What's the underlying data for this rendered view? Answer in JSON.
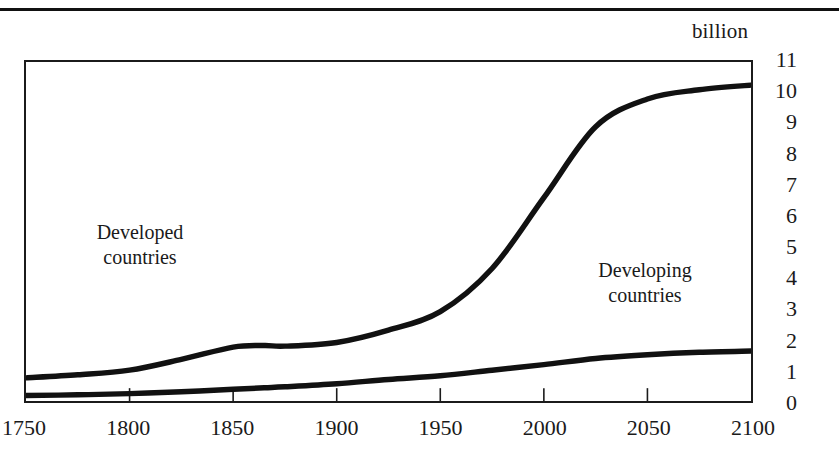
{
  "figure": {
    "unit_caption": "billion",
    "rule": true
  },
  "axes": {
    "y_ticks": [
      0,
      1,
      2,
      3,
      4,
      5,
      6,
      7,
      8,
      9,
      10,
      11
    ],
    "y_tick_labels": [
      "0",
      "1",
      "2",
      "3",
      "4",
      "5",
      "6",
      "7",
      "8",
      "9",
      "10",
      "11"
    ],
    "x_ticks": [
      1750,
      1800,
      1850,
      1900,
      1950,
      2000,
      2050,
      2100
    ],
    "x_tick_labels": [
      "1750",
      "1800",
      "1850",
      "1900",
      "1950",
      "2000",
      "2050",
      "2100"
    ]
  },
  "annotations": {
    "developed": {
      "line1": "Developed",
      "line2": "countries"
    },
    "developing": {
      "line1": "Developing",
      "line2": "countries"
    }
  },
  "style": {
    "curve_color": "#111111",
    "frame_color": "#1b1b1b",
    "background": "#ffffff"
  },
  "chart_data": {
    "type": "line",
    "title": "",
    "subtitle": "",
    "xlabel": "",
    "ylabel": "billion",
    "xlim": [
      1750,
      2100
    ],
    "ylim": [
      0,
      11
    ],
    "grid": false,
    "legend": "in-plot annotations",
    "x": [
      1750,
      1775,
      1800,
      1825,
      1850,
      1865,
      1875,
      1900,
      1925,
      1950,
      1975,
      2000,
      2025,
      2050,
      2075,
      2100
    ],
    "series": [
      {
        "name": "Developing countries",
        "annotation": "Developing countries",
        "note": "upper curve; total of developing-country population",
        "values": [
          0.75,
          0.85,
          1.0,
          1.35,
          1.75,
          1.8,
          1.78,
          1.9,
          2.3,
          2.9,
          4.3,
          6.6,
          8.9,
          9.8,
          10.1,
          10.25
        ]
      },
      {
        "name": "Developed countries",
        "annotation": "Developed countries",
        "note": "lower curve; developed-country population",
        "values": [
          0.18,
          0.2,
          0.24,
          0.3,
          0.38,
          0.43,
          0.46,
          0.56,
          0.7,
          0.82,
          1.0,
          1.18,
          1.38,
          1.5,
          1.58,
          1.62
        ]
      }
    ]
  }
}
